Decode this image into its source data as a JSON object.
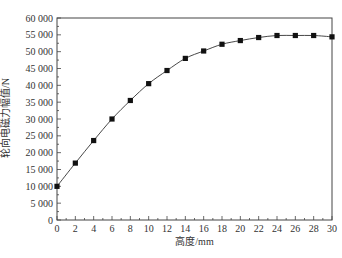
{
  "chart_data": {
    "type": "line",
    "title": "",
    "xlabel": "高度/mm",
    "ylabel": "轮向电磁力幅值/N",
    "xlim": [
      0,
      30
    ],
    "ylim": [
      0,
      60000
    ],
    "x_ticks": [
      0,
      2,
      4,
      6,
      8,
      10,
      12,
      14,
      16,
      18,
      20,
      22,
      24,
      26,
      28,
      30
    ],
    "x_tick_labels": [
      "0",
      "2",
      "4",
      "6",
      "8",
      "10",
      "12",
      "14",
      "16",
      "18",
      "20",
      "22",
      "24",
      "26",
      "28",
      "30"
    ],
    "y_ticks": [
      0,
      5000,
      10000,
      15000,
      20000,
      25000,
      30000,
      35000,
      40000,
      45000,
      50000,
      55000,
      60000
    ],
    "y_tick_labels": [
      "0",
      "5 000",
      "10 000",
      "15 000",
      "20 000",
      "25 000",
      "30 000",
      "35 000",
      "40 000",
      "45 000",
      "50 000",
      "55 000",
      "60 000"
    ],
    "grid": false,
    "legend": null,
    "marker": "square",
    "line_color": "#333333",
    "marker_color": "#111111",
    "x": [
      0,
      2,
      4,
      6,
      8,
      10,
      12,
      14,
      16,
      18,
      20,
      22,
      24,
      26,
      28,
      30
    ],
    "series": [
      {
        "name": "轮向电磁力幅值",
        "values": [
          10000,
          16900,
          23600,
          30000,
          35500,
          40500,
          44400,
          48000,
          50200,
          52200,
          53300,
          54200,
          54800,
          54800,
          54800,
          54400
        ]
      }
    ]
  }
}
